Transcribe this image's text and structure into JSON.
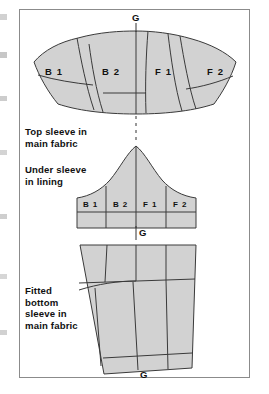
{
  "figure": {
    "frame_color": "#8b8b8b",
    "piece_fill": "#d2d2d2",
    "piece_stroke": "#3a3a3a",
    "background": "#ffffff"
  },
  "captions": {
    "top_sleeve": "Top sleeve in\nmain fabric",
    "under_sleeve": "Under sleeve\nin lining",
    "bottom_sleeve": "Fitted\nbottom\nsleeve in\nmain fabric"
  },
  "grain_marks": {
    "top": "G",
    "middle": "G",
    "bottom": "G"
  },
  "pieces": [
    {
      "name": "top-sleeve",
      "caption": "Top sleeve in main fabric",
      "panels": [
        "B 1",
        "B 2",
        "F 1",
        "F 2"
      ]
    },
    {
      "name": "under-sleeve",
      "caption": "Under sleeve in lining",
      "panels": [
        "B 1",
        "B 2",
        "F 1",
        "F 2"
      ]
    },
    {
      "name": "fitted-bottom-sleeve",
      "caption": "Fitted bottom sleeve in main fabric",
      "panels": []
    }
  ],
  "panels": {
    "top": {
      "b1": "B 1",
      "b2": "B 2",
      "f1": "F 1",
      "f2": "F 2"
    },
    "under": {
      "b1": "B 1",
      "b2": "B 2",
      "f1": "F 1",
      "f2": "F 2"
    }
  }
}
